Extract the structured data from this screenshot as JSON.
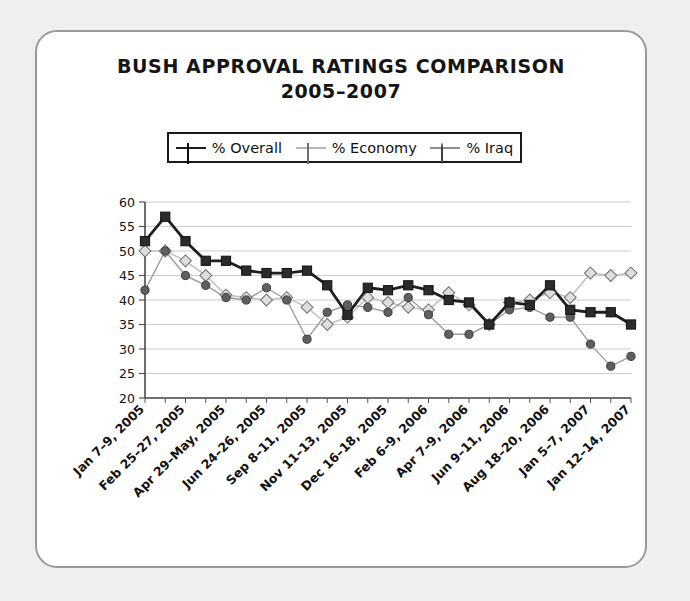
{
  "card": {
    "title_line1": "BUSH APPROVAL RATINGS COMPARISON",
    "title_line2": "2005–2007"
  },
  "legend": {
    "position": "above-plot",
    "items": [
      {
        "label": "% Overall",
        "marker": "square",
        "color": "#262626"
      },
      {
        "label": "% Economy",
        "marker": "diamond",
        "color": "#d8d8d8"
      },
      {
        "label": "% Iraq",
        "marker": "circle",
        "color": "#5d5d5d"
      }
    ]
  },
  "chart_data": {
    "type": "line",
    "title": "BUSH APPROVAL RATINGS COMPARISON 2005–2007",
    "xlabel": "",
    "ylabel": "",
    "ylim": [
      20,
      60
    ],
    "yticks": [
      20,
      25,
      30,
      35,
      40,
      45,
      50,
      55,
      60
    ],
    "grid": true,
    "legend_position": "top",
    "xtick_labels": [
      "Jan 7–9, 2005",
      "Feb 25–27, 2005",
      "Apr 29–May, 2005",
      "Jun 24–26, 2005",
      "Sep 8–11, 2005",
      "Nov 11–13, 2005",
      "Dec 16–18, 2005",
      "Feb 6–9, 2006",
      "Apr 7–9, 2006",
      "Jun 9–11, 2006",
      "Aug 18–20, 2006",
      "Jan 5–7, 2007",
      "Jan 12–14, 2007"
    ],
    "x_index": [
      0,
      1,
      2,
      3,
      4,
      5,
      6,
      7,
      8,
      9,
      10,
      11,
      12,
      13,
      14,
      15,
      16,
      17,
      18,
      19,
      20,
      21,
      22,
      23,
      24
    ],
    "series": [
      {
        "name": "% Overall",
        "marker": "square",
        "color": "#262626",
        "values": [
          52,
          57,
          52,
          48,
          48,
          46,
          45.5,
          45.5,
          46,
          43,
          37,
          42.5,
          42,
          43,
          42,
          40,
          39.5,
          35,
          39.5,
          39,
          43,
          38,
          37.5,
          37.5,
          35
        ]
      },
      {
        "name": "% Economy",
        "marker": "diamond",
        "color": "#d8d8d8",
        "values": [
          50,
          50,
          48,
          45,
          41,
          40.5,
          40,
          40.5,
          38.5,
          35,
          36.5,
          40.5,
          39.5,
          38.5,
          38,
          41.5,
          39,
          35,
          39.5,
          40,
          41.5,
          40.5,
          45.5,
          45,
          45.5
        ]
      },
      {
        "name": "% Iraq",
        "marker": "circle",
        "color": "#5d5d5d",
        "values": [
          42,
          50,
          45,
          43,
          40.5,
          40,
          42.5,
          40,
          32,
          37.5,
          39,
          38.5,
          37.5,
          40.5,
          37,
          33,
          33,
          35,
          38,
          38.5,
          36.5,
          36.5,
          31,
          26.5,
          28.5
        ]
      }
    ]
  }
}
